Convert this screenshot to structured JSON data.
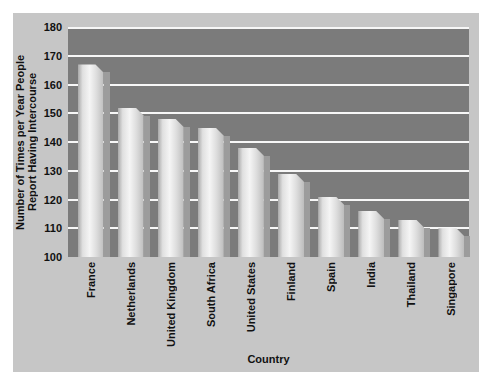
{
  "chart_data": {
    "type": "bar",
    "title": "",
    "categories": [
      "France",
      "Netherlands",
      "United Kingdom",
      "South Africa",
      "United States",
      "Finland",
      "Spain",
      "India",
      "Thailand",
      "Singapore"
    ],
    "values": [
      167,
      152,
      148,
      145,
      138,
      129,
      121,
      116,
      113,
      110
    ],
    "xlabel": "Country",
    "ylabel_line1": "Number of Times per Year People",
    "ylabel_line2": "Report Having Intercourse",
    "ylim": [
      100,
      180
    ],
    "yticks": [
      100,
      110,
      120,
      130,
      140,
      150,
      160,
      170,
      180
    ],
    "grid": "horizontal",
    "legend": "none",
    "bar_style": "3d-chamfered-with-shadow"
  },
  "colors": {
    "page_background": "#ffffff",
    "panel_background": "#c6c6c6",
    "plot_background": "#7b7b7b",
    "gridline": "#f7f7f7",
    "bar_highlight": "#f5f5f5",
    "bar_edge": "#a9a9a9",
    "bar_shadow": "#9c9c9c",
    "text": "#111111"
  }
}
